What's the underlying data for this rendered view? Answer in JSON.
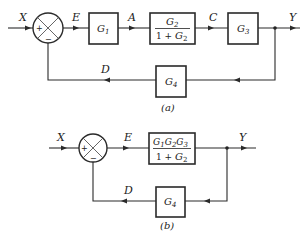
{
  "diagram_a": {
    "caption": "(a)",
    "signals": {
      "input": "X",
      "error": "E",
      "a": "A",
      "c": "C",
      "output": "Y",
      "feedback": "D"
    },
    "summing_junction": {
      "plus": "+",
      "minus": "−"
    },
    "blocks": {
      "g1": {
        "base": "G",
        "sub": "1"
      },
      "g2": {
        "num_base": "G",
        "num_sub": "2",
        "den_prefix": "1 + ",
        "den_base": "G",
        "den_sub": "2"
      },
      "g3": {
        "base": "G",
        "sub": "3"
      },
      "g4": {
        "base": "G",
        "sub": "4"
      }
    }
  },
  "diagram_b": {
    "caption": "(b)",
    "signals": {
      "input": "X",
      "error": "E",
      "output": "Y",
      "feedback": "D"
    },
    "summing_junction": {
      "plus": "+",
      "minus": "−"
    },
    "blocks": {
      "forward": {
        "num": [
          "G",
          "1",
          "G",
          "2",
          "G",
          "3"
        ],
        "den_prefix": "1 + ",
        "den_base": "G",
        "den_sub": "2"
      },
      "g4": {
        "base": "G",
        "sub": "4"
      }
    }
  }
}
